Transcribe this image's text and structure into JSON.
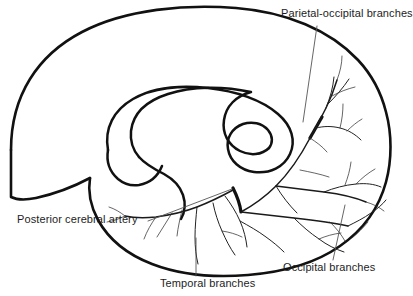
{
  "figure": {
    "background_color": "#ffffff",
    "line_color": "#111111",
    "text_color": "#1d1d1d",
    "width": 413,
    "height": 296
  },
  "labels": {
    "parietal_occipital": "Parietal-occipital branches",
    "posterior_cerebral": "Posterior cerebral artery",
    "temporal": "Temporal branches",
    "occipital": "Occipital branches"
  },
  "structures": {
    "brain_outline": "cerebral-hemisphere-medial-outline",
    "corpus_callosum": "corpus-callosum-spiral-outline",
    "artery_trunk": "posterior-cerebral-artery-trunk",
    "occipital_pole": "occipital-lobe",
    "temporal_pole": "temporal-lobe"
  }
}
